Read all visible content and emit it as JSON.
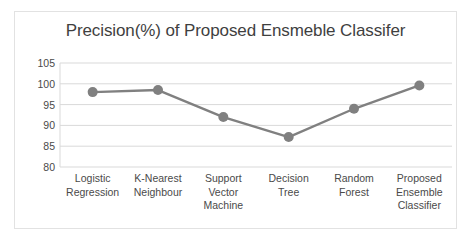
{
  "chart_data": {
    "type": "line",
    "title": "Precision(%) of Proposed Ensmeble Classifer",
    "xlabel": "",
    "ylabel": "",
    "categories": [
      "Logistic Regression",
      "K-Nearest Neighbour",
      "Support Vector Machine",
      "Decision Tree",
      "Random Forest",
      "Proposed Ensemble Classifier"
    ],
    "category_lines": [
      [
        "Logistic",
        "Regression"
      ],
      [
        "K-Nearest",
        "Neighbour"
      ],
      [
        "Support",
        "Vector",
        "Machine"
      ],
      [
        "Decision",
        "Tree"
      ],
      [
        "Random",
        "Forest"
      ],
      [
        "Proposed",
        "Ensemble",
        "Classifier"
      ]
    ],
    "values": [
      98.0,
      98.5,
      92.0,
      87.2,
      94.0,
      99.6
    ],
    "ylim": [
      80,
      105
    ],
    "ytick_labels": [
      "105",
      "100",
      "95",
      "90",
      "85",
      "80"
    ],
    "ytick_values": [
      105,
      100,
      95,
      90,
      85,
      80
    ],
    "grid": true,
    "legend": false,
    "series_color": "#808080",
    "grid_color": "#d9d9d9",
    "axis_color": "#d9d9d9",
    "text_color": "#4a4a4a",
    "title_color": "#3f3f3f",
    "marker": "circle",
    "marker_size": 5,
    "line_width": 2.4
  }
}
